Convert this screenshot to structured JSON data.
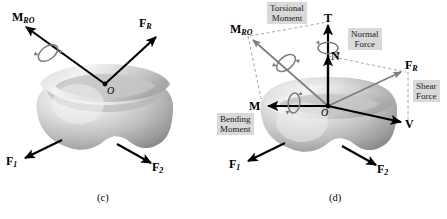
{
  "figure": {
    "title_alt": "Resultant force and moment at point O resolved into components",
    "background_color": "#ffffff",
    "annotation_box_color": "#d9d9d9",
    "body_color_light": "#f2f2f2",
    "body_color_dark": "#8a8a8a",
    "arrow_color": "#000000",
    "dashed_color": "#9a9a9a",
    "spiral_color": "#7d7d7d"
  },
  "panel_c": {
    "caption": "(c)",
    "origin_label": "O",
    "vectors": [
      {
        "name": "resultant-moment",
        "label_main": "M",
        "label_sub": "RO",
        "tip": [
          22,
          24
        ],
        "tail": [
          105,
          84
        ]
      },
      {
        "name": "resultant-force",
        "label_main": "F",
        "label_sub": "R",
        "tip": [
          160,
          34
        ],
        "tail": [
          105,
          84
        ]
      },
      {
        "name": "force-1",
        "label_main": "F",
        "label_sub": "1",
        "tip": [
          21,
          160
        ],
        "tail": [
          62,
          140
        ]
      },
      {
        "name": "force-2",
        "label_main": "F",
        "label_sub": "2",
        "tip": [
          155,
          166
        ],
        "tail": [
          117,
          144
        ]
      }
    ],
    "spiral": {
      "name": "torsion-curl",
      "about": "resultant-moment"
    }
  },
  "panel_d": {
    "caption": "(d)",
    "origin_label": "O",
    "vectors": [
      {
        "name": "resultant-moment",
        "label_main": "M",
        "label_sub": "RO",
        "tip": [
          22,
          32
        ],
        "tail": [
          105,
          106
        ]
      },
      {
        "name": "torsional-moment",
        "label_main": "T",
        "label_sub": "",
        "tip": [
          105,
          18
        ],
        "tail": [
          105,
          106
        ]
      },
      {
        "name": "normal-force",
        "label_main": "N",
        "label_sub": "",
        "tip": [
          105,
          50
        ],
        "tail": [
          105,
          106
        ]
      },
      {
        "name": "resultant-force",
        "label_main": "F",
        "label_sub": "R",
        "tip": [
          182,
          70
        ],
        "tail": [
          105,
          106
        ]
      },
      {
        "name": "bending-moment",
        "label_main": "M",
        "label_sub": "",
        "tip": [
          39,
          106
        ],
        "tail": [
          105,
          106
        ]
      },
      {
        "name": "shear-force",
        "label_main": "V",
        "label_sub": "",
        "tip": [
          182,
          124
        ],
        "tail": [
          105,
          106
        ]
      },
      {
        "name": "force-1",
        "label_main": "F",
        "label_sub": "1",
        "tip": [
          21,
          163
        ],
        "tail": [
          62,
          143
        ]
      },
      {
        "name": "force-2",
        "label_main": "F",
        "label_sub": "2",
        "tip": [
          157,
          168
        ],
        "tail": [
          119,
          146
        ]
      }
    ],
    "annotations": [
      {
        "name": "torsional-moment-annotation",
        "line1": "Torsional",
        "line2": "Moment"
      },
      {
        "name": "normal-force-annotation",
        "line1": "Normal",
        "line2": "Force"
      },
      {
        "name": "shear-force-annotation",
        "line1": "Shear",
        "line2": "Force"
      },
      {
        "name": "bending-moment-annotation",
        "line1": "Bending",
        "line2": "Moment"
      }
    ],
    "construction_lines": [
      {
        "name": "moment-parallelogram-top",
        "from": [
          22,
          32
        ],
        "to": [
          105,
          18
        ]
      },
      {
        "name": "moment-vertical-guide",
        "from": [
          22,
          32
        ],
        "to": [
          39,
          106
        ]
      },
      {
        "name": "force-parallelogram-top",
        "from": [
          105,
          50
        ],
        "to": [
          182,
          70
        ]
      },
      {
        "name": "force-vertical-guide",
        "from": [
          182,
          70
        ],
        "to": [
          182,
          124
        ]
      }
    ],
    "spirals": [
      {
        "name": "torsional-curl",
        "about": "torsional-moment"
      },
      {
        "name": "resultant-moment-curl",
        "about": "resultant-moment"
      },
      {
        "name": "bending-curl",
        "about": "bending-moment"
      }
    ]
  }
}
